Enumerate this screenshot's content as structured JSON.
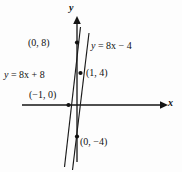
{
  "figure": {
    "kind": "coordinate-graph",
    "background_color": "#fdfdfd",
    "ink_color": "#111111"
  },
  "axes": {
    "x_label": "x",
    "y_label": "y",
    "x_axis": {
      "x1": 22,
      "y1": 105,
      "x2": 165,
      "y2": 105,
      "arrow": "right"
    },
    "y_axis": {
      "x1": 77,
      "y1": 160,
      "x2": 77,
      "y2": 16,
      "arrow": "up"
    }
  },
  "labels": {
    "point_0_8": "(0, 8)",
    "point_1_4": "(1, 4)",
    "point_neg1_0": "(−1, 0)",
    "point_0_neg4": "(0, −4)",
    "equation_left": "y = 8x + 8",
    "equation_right": "y = 8x − 4"
  },
  "chart_data": {
    "type": "line",
    "title": "",
    "xlabel": "x",
    "ylabel": "y",
    "grid": false,
    "legend": "inline-annotations",
    "xlim": [
      -2.2,
      2.6
    ],
    "ylim": [
      -7.5,
      11.0
    ],
    "series": [
      {
        "name": "y = 8x + 8",
        "slope": 8,
        "intercept": 8,
        "equation": "y = 8x + 8",
        "points": [
          {
            "label": "(−1, 0)",
            "x": -1,
            "y": 0,
            "marked": true
          },
          {
            "label": "(0, 8)",
            "x": 0,
            "y": 8,
            "marked": true
          }
        ],
        "x_range": [
          -1.65,
          -0.32
        ],
        "y_range": [
          -5.2,
          5.4
        ]
      },
      {
        "name": "y = 8x − 4",
        "slope": 8,
        "intercept": -4,
        "equation": "y = 8x − 4",
        "points": [
          {
            "label": "(0, −4)",
            "x": 0,
            "y": -4,
            "marked": true
          },
          {
            "label": "(1, 4)",
            "x": 1,
            "y": 4,
            "marked": true
          }
        ],
        "x_range": [
          -0.38,
          0.9
        ],
        "y_range": [
          -7.0,
          3.2
        ]
      }
    ]
  }
}
